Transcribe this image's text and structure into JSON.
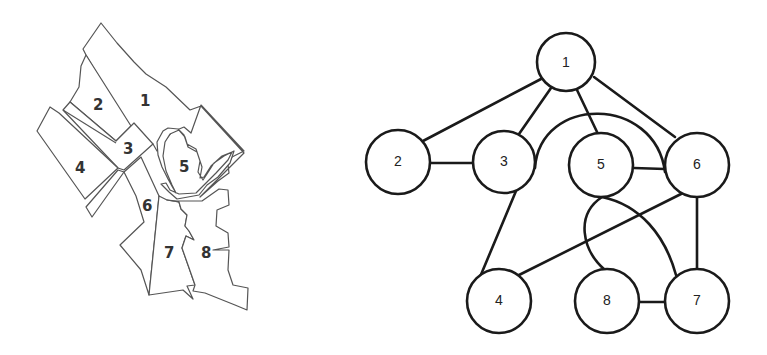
{
  "map": {
    "regions": [
      {
        "id": "1",
        "label": "1",
        "label_x": 145,
        "label_y": 106
      },
      {
        "id": "2",
        "label": "2",
        "label_x": 98,
        "label_y": 110
      },
      {
        "id": "3",
        "label": "3",
        "label_x": 129,
        "label_y": 154
      },
      {
        "id": "4",
        "label": "4",
        "label_x": 80,
        "label_y": 173
      },
      {
        "id": "5",
        "label": "5",
        "label_x": 184,
        "label_y": 172
      },
      {
        "id": "6",
        "label": "6",
        "label_x": 148,
        "label_y": 211
      },
      {
        "id": "7",
        "label": "7",
        "label_x": 169,
        "label_y": 258
      },
      {
        "id": "8",
        "label": "8",
        "label_x": 207,
        "label_y": 258
      }
    ]
  },
  "graph": {
    "node_radius": 31,
    "nodes": [
      {
        "id": "1",
        "label": "1",
        "x": 566,
        "y": 62
      },
      {
        "id": "2",
        "label": "2",
        "x": 398,
        "y": 162
      },
      {
        "id": "3",
        "label": "3",
        "x": 504,
        "y": 162
      },
      {
        "id": "5",
        "label": "5",
        "x": 601,
        "y": 165
      },
      {
        "id": "6",
        "label": "6",
        "x": 697,
        "y": 165
      },
      {
        "id": "4",
        "label": "4",
        "x": 499,
        "y": 301
      },
      {
        "id": "8",
        "label": "8",
        "x": 607,
        "y": 301
      },
      {
        "id": "7",
        "label": "7",
        "x": 697,
        "y": 301
      }
    ],
    "edges": [
      {
        "from": "1",
        "to": "2",
        "type": "line"
      },
      {
        "from": "1",
        "to": "3",
        "type": "line"
      },
      {
        "from": "1",
        "to": "5",
        "type": "line"
      },
      {
        "from": "1",
        "to": "6",
        "type": "line"
      },
      {
        "from": "2",
        "to": "3",
        "type": "line"
      },
      {
        "from": "3",
        "to": "6",
        "type": "arc"
      },
      {
        "from": "3",
        "to": "4",
        "type": "line"
      },
      {
        "from": "5",
        "to": "6",
        "type": "line"
      },
      {
        "from": "5",
        "to": "7",
        "type": "arc"
      },
      {
        "from": "5",
        "to": "8",
        "type": "arc"
      },
      {
        "from": "6",
        "to": "4",
        "type": "line"
      },
      {
        "from": "6",
        "to": "7",
        "type": "line"
      },
      {
        "from": "8",
        "to": "7",
        "type": "line"
      }
    ]
  }
}
